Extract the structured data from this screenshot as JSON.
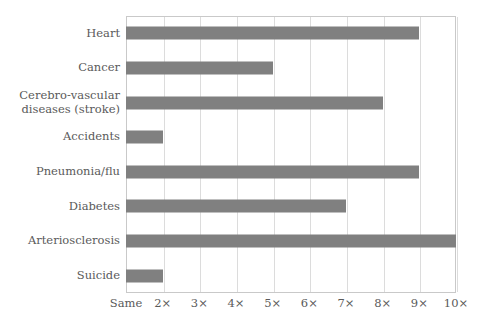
{
  "chart_data": {
    "type": "bar",
    "orientation": "horizontal",
    "title": "",
    "xlabel": "",
    "ylabel": "",
    "categories": [
      "Heart",
      "Cancer",
      "Cerebro-vascular\ndiseases (stroke)",
      "Accidents",
      "Pneumonia/flu",
      "Diabetes",
      "Arteriosclerosis",
      "Suicide"
    ],
    "values": [
      9,
      5,
      8,
      2,
      9,
      7,
      10,
      2
    ],
    "xlim": [
      1,
      10
    ],
    "xticks": [
      1,
      2,
      3,
      4,
      5,
      6,
      7,
      8,
      9,
      10
    ],
    "xticklabels": [
      "Same",
      "2×",
      "3×",
      "4×",
      "5×",
      "6×",
      "7×",
      "8×",
      "9×",
      "10×"
    ],
    "grid": "vertical",
    "legend": "none",
    "bar_color": "#808080",
    "gridline_color": "#dcdcdc",
    "frame_color": "#c9c9c9",
    "text_color": "#5a5a5a",
    "background_color": "#ffffff"
  }
}
